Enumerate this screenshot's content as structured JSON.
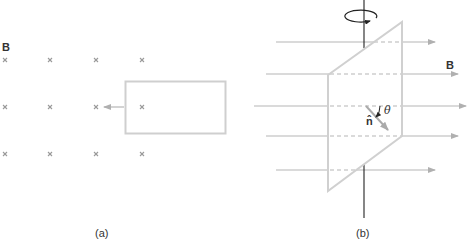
{
  "figure": {
    "panel_a": {
      "caption": "(a)",
      "field_label": "B",
      "field_symbol": "cross (into page)",
      "grid_rows": 3,
      "grid_cols": 4,
      "loop_shape": "rectangle",
      "motion_direction": "left"
    },
    "panel_b": {
      "caption": "(b)",
      "field_label": "B",
      "normal_label": "n̂",
      "angle_label": "θ",
      "rotation_axis": "vertical",
      "loop_shape": "parallelogram",
      "field_line_count": 5
    },
    "colors": {
      "stroke": "#b5b5b5",
      "loop": "#cfcfcf",
      "axis": "#222222",
      "text": "#333333"
    }
  }
}
